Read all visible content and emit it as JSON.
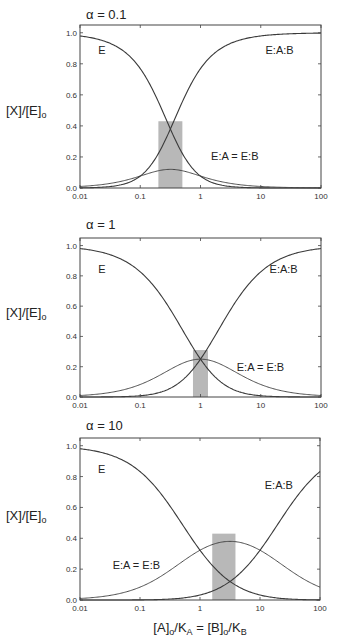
{
  "figure": {
    "ylabel": "[X]/[E]",
    "ylabel_sub": "o",
    "xlabel_parts": [
      "[A]",
      "o",
      "/K",
      "A",
      " = [B]",
      "o",
      "/K",
      "B"
    ],
    "x_ticks": [
      "0.01",
      "0.1",
      "1",
      "10",
      "100"
    ],
    "y_ticks": [
      "0.0",
      "0.2",
      "0.4",
      "0.6",
      "0.8",
      "1.0"
    ],
    "colors": {
      "curve": "#3a3a3a",
      "bar": "#b8b8b8",
      "axis": "#444444"
    }
  },
  "chart_data": [
    {
      "type": "line",
      "title": "α = 0.1",
      "alpha": 0.1,
      "xscale": "log",
      "xlim": [
        0.01,
        100
      ],
      "ylim": [
        0,
        1.05
      ],
      "xlabel": "",
      "ylabel": "[X]/[E]o",
      "x": [
        0.01,
        0.03,
        0.1,
        0.2,
        0.316,
        0.5,
        1,
        3,
        10,
        30,
        100
      ],
      "series": [
        {
          "name": "E",
          "values": [
            0.979,
            0.936,
            0.758,
            0.538,
            0.384,
            0.238,
            0.077,
            0.01,
            0.001,
            0.0,
            0.0
          ]
        },
        {
          "name": "E:A:B",
          "values": [
            0.001,
            0.008,
            0.076,
            0.215,
            0.384,
            0.595,
            0.769,
            0.908,
            0.98,
            0.993,
            0.998
          ]
        },
        {
          "name": "E:A = E:B",
          "values": [
            0.01,
            0.028,
            0.076,
            0.108,
            0.121,
            0.119,
            0.077,
            0.03,
            0.01,
            0.003,
            0.001
          ]
        }
      ],
      "labels": [
        {
          "text": "E",
          "x": 0.02,
          "y": 0.86
        },
        {
          "text": "E:A:B",
          "x": 12,
          "y": 0.86
        },
        {
          "text": "E:A = E:B",
          "x": 1.5,
          "y": 0.18
        }
      ],
      "shaded_region": {
        "x_from": 0.2,
        "x_to": 0.5,
        "y_to": 0.43
      }
    },
    {
      "type": "line",
      "title": "α = 1",
      "alpha": 1,
      "xscale": "log",
      "xlim": [
        0.01,
        100
      ],
      "ylim": [
        0,
        1.05
      ],
      "xlabel": "",
      "ylabel": "[X]/[E]o",
      "x": [
        0.01,
        0.03,
        0.1,
        0.3,
        1,
        3,
        10,
        30,
        100
      ],
      "series": [
        {
          "name": "E",
          "values": [
            0.98,
            0.943,
            0.826,
            0.592,
            0.25,
            0.063,
            0.008,
            0.001,
            0.0
          ]
        },
        {
          "name": "E:A:B",
          "values": [
            0.0,
            0.001,
            0.008,
            0.053,
            0.25,
            0.563,
            0.826,
            0.943,
            0.98
          ]
        },
        {
          "name": "E:A = E:B",
          "values": [
            0.01,
            0.028,
            0.083,
            0.178,
            0.25,
            0.188,
            0.083,
            0.031,
            0.01
          ]
        }
      ],
      "labels": [
        {
          "text": "E",
          "x": 0.02,
          "y": 0.82
        },
        {
          "text": "E:A:B",
          "x": 14,
          "y": 0.82
        },
        {
          "text": "E:A = E:B",
          "x": 4,
          "y": 0.17
        }
      ],
      "shaded_region": {
        "x_from": 0.75,
        "x_to": 1.33,
        "y_to": 0.31
      }
    },
    {
      "type": "line",
      "title": "α = 10",
      "alpha": 10,
      "xscale": "log",
      "xlim": [
        0.01,
        100
      ],
      "ylim": [
        0,
        1.05
      ],
      "xlabel": "[A]o/KA = [B]o/KB",
      "ylabel": "[X]/[E]o",
      "x": [
        0.01,
        0.03,
        0.1,
        0.3,
        1,
        3.16,
        10,
        30,
        100
      ],
      "series": [
        {
          "name": "E",
          "values": [
            0.98,
            0.943,
            0.832,
            0.623,
            0.323,
            0.12,
            0.031,
            0.006,
            0.001
          ]
        },
        {
          "name": "E:A:B",
          "values": [
            0.0,
            0.0,
            0.001,
            0.006,
            0.032,
            0.12,
            0.323,
            0.623,
            0.832
          ]
        },
        {
          "name": "E:A = E:B",
          "values": [
            0.01,
            0.028,
            0.083,
            0.187,
            0.323,
            0.38,
            0.323,
            0.187,
            0.083
          ]
        }
      ],
      "labels": [
        {
          "text": "E",
          "x": 0.02,
          "y": 0.82
        },
        {
          "text": "E:A:B",
          "x": 12,
          "y": 0.72
        },
        {
          "text": "E:A = E:B",
          "x": 0.035,
          "y": 0.2
        }
      ],
      "shaded_region": {
        "x_from": 1.6,
        "x_to": 3.9,
        "y_to": 0.43
      }
    }
  ]
}
